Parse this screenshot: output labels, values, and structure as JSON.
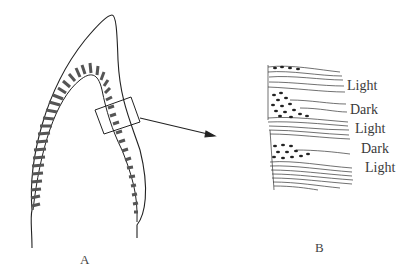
{
  "figure": {
    "panels": [
      {
        "id": "A",
        "label": "A",
        "subject": "tooth cross-section with dentinal bands"
      },
      {
        "id": "B",
        "label": "B",
        "subject": "magnified region showing alternating bands"
      }
    ],
    "band_labels": [
      "Light",
      "Dark",
      "Light",
      "Dark",
      "Light"
    ],
    "colors": {
      "ink": "#222222",
      "background": "#ffffff"
    }
  }
}
